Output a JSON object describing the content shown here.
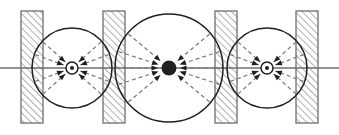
{
  "figure": {
    "width": 339,
    "height": 135,
    "background_color": "#ffffff",
    "stroke_color": "#231f20",
    "axis_color": "#6e6e6e",
    "hatch_color": "#6e6e6e",
    "plate_fill": "#ffffff",
    "dashed_color": "#7a7a7a"
  },
  "axis": {
    "label": "optical-axis",
    "y": 68,
    "x_start": 0,
    "x_end": 339,
    "color": "#6e6e6e",
    "width": 1.6
  },
  "plates": [
    {
      "name": "plate-1",
      "x": 21,
      "y": 11,
      "width": 22,
      "height": 112
    },
    {
      "name": "plate-2",
      "x": 103,
      "y": 11,
      "width": 22,
      "height": 112
    },
    {
      "name": "plate-3",
      "x": 215,
      "y": 11,
      "width": 22,
      "height": 112
    },
    {
      "name": "plate-4",
      "x": 296,
      "y": 11,
      "width": 22,
      "height": 112
    }
  ],
  "circles": [
    {
      "name": "circle-left",
      "cx": 72,
      "cy": 68,
      "r": 40
    },
    {
      "name": "circle-center",
      "cx": 169,
      "cy": 68,
      "r": 54
    },
    {
      "name": "circle-right",
      "cx": 267,
      "cy": 68,
      "r": 40
    }
  ],
  "focal_points": [
    {
      "name": "focus-left",
      "cx": 72,
      "cy": 68,
      "type": "ring-dot",
      "ring_r": 6.0,
      "dot_r": 2.0
    },
    {
      "name": "focus-center",
      "cx": 169,
      "cy": 68,
      "type": "filled-dot",
      "dot_r": 7.5
    },
    {
      "name": "focus-right",
      "cx": 267,
      "cy": 68,
      "type": "ring-dot",
      "ring_r": 6.0,
      "dot_r": 2.0
    }
  ],
  "ray_groups": [
    {
      "name": "rays-left",
      "target_x": 72,
      "target_y": 68,
      "start_radius": 39,
      "stop_radius": 9,
      "angles_deg": [
        138,
        160,
        200,
        222,
        42,
        20,
        340,
        318
      ]
    },
    {
      "name": "rays-center",
      "target_x": 169,
      "target_y": 68,
      "start_radius": 53,
      "stop_radius": 11,
      "angles_deg": [
        140,
        162,
        180,
        198,
        220,
        40,
        18,
        0,
        342,
        320
      ]
    },
    {
      "name": "rays-right",
      "target_x": 267,
      "target_y": 68,
      "start_radius": 39,
      "stop_radius": 9,
      "angles_deg": [
        138,
        160,
        200,
        222,
        42,
        20,
        340,
        318
      ]
    }
  ],
  "hatch": {
    "name": "diagonal-hatch",
    "direction": "bottom-left-to-top-right",
    "spacing": 5,
    "line_width": 1.1,
    "color": "#6e6e6e"
  },
  "arrowhead": {
    "name": "arrowhead",
    "length": 6.5,
    "half_width": 2.6,
    "color": "#231f20"
  },
  "dash": {
    "pattern": "4,3",
    "width": 1.2
  }
}
